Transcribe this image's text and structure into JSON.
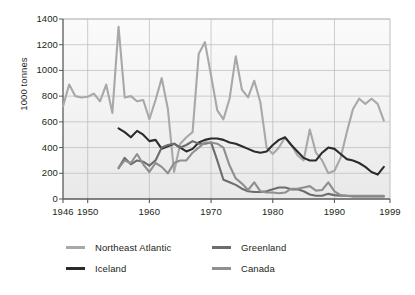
{
  "chart_data": {
    "type": "line",
    "title": "",
    "subtitle": "",
    "xlabel": "",
    "ylabel": "1000 tonnes",
    "xlim": [
      1946,
      1999
    ],
    "ylim": [
      0,
      1400
    ],
    "yticks": [
      0,
      200,
      400,
      600,
      800,
      1000,
      1200,
      1400
    ],
    "xticks": [
      1946,
      1950,
      1960,
      1970,
      1980,
      1990,
      1999
    ],
    "xtick_labels": [
      "1946",
      "1950",
      "1960",
      "1970",
      "1980",
      "1990",
      "1999"
    ],
    "ytick_labels": [
      "0",
      "200",
      "400",
      "600",
      "800",
      "1000",
      "1200",
      "1400"
    ],
    "grid": "horizontal-and-vertical",
    "legend_position": "bottom",
    "series": [
      {
        "name": "Northeast Atlantic",
        "color": "#a8a8a8",
        "x": [
          1946,
          1947,
          1948,
          1949,
          1950,
          1951,
          1952,
          1953,
          1954,
          1955,
          1956,
          1957,
          1958,
          1959,
          1960,
          1961,
          1962,
          1963,
          1964,
          1965,
          1966,
          1967,
          1968,
          1969,
          1970,
          1971,
          1972,
          1973,
          1974,
          1975,
          1976,
          1977,
          1978,
          1979,
          1980,
          1981,
          1982,
          1983,
          1984,
          1985,
          1986,
          1987,
          1988,
          1989,
          1990,
          1991,
          1992,
          1993,
          1994,
          1995,
          1996,
          1997,
          1998
        ],
        "values": [
          720,
          890,
          800,
          790,
          795,
          820,
          760,
          890,
          670,
          1340,
          790,
          800,
          760,
          770,
          620,
          770,
          940,
          700,
          210,
          430,
          480,
          520,
          1130,
          1220,
          960,
          690,
          620,
          780,
          1110,
          850,
          790,
          920,
          750,
          400,
          350,
          400,
          480,
          420,
          340,
          300,
          540,
          360,
          300,
          200,
          220,
          320,
          520,
          700,
          780,
          740,
          780,
          740,
          610
        ]
      },
      {
        "name": "Iceland",
        "color": "#2b2b2b",
        "x": [
          1955,
          1956,
          1957,
          1958,
          1959,
          1960,
          1961,
          1962,
          1963,
          1964,
          1965,
          1966,
          1967,
          1968,
          1969,
          1970,
          1971,
          1972,
          1973,
          1974,
          1975,
          1976,
          1977,
          1978,
          1979,
          1980,
          1981,
          1982,
          1983,
          1984,
          1985,
          1986,
          1987,
          1988,
          1989,
          1990,
          1991,
          1992,
          1993,
          1994,
          1995,
          1996,
          1997,
          1998
        ],
        "values": [
          550,
          520,
          480,
          530,
          500,
          450,
          460,
          390,
          410,
          430,
          400,
          370,
          390,
          440,
          460,
          470,
          470,
          460,
          440,
          430,
          410,
          390,
          370,
          360,
          370,
          420,
          460,
          480,
          420,
          370,
          320,
          300,
          300,
          360,
          400,
          390,
          350,
          310,
          300,
          280,
          250,
          210,
          190,
          250
        ]
      },
      {
        "name": "Greenland",
        "color": "#6d6d6d",
        "x": [
          1955,
          1956,
          1957,
          1958,
          1959,
          1960,
          1961,
          1962,
          1963,
          1964,
          1965,
          1966,
          1967,
          1968,
          1969,
          1970,
          1971,
          1972,
          1973,
          1974,
          1975,
          1976,
          1977,
          1978,
          1979,
          1980,
          1981,
          1982,
          1983,
          1984,
          1985,
          1986,
          1987,
          1988,
          1989,
          1990,
          1991,
          1992,
          1993,
          1994,
          1995,
          1996,
          1997,
          1998
        ],
        "values": [
          240,
          320,
          270,
          300,
          290,
          260,
          300,
          400,
          420,
          430,
          400,
          420,
          450,
          430,
          430,
          440,
          300,
          150,
          130,
          110,
          80,
          60,
          55,
          55,
          60,
          75,
          90,
          90,
          75,
          75,
          60,
          35,
          25,
          25,
          40,
          30,
          25,
          25,
          20,
          20,
          20,
          20,
          20,
          20
        ]
      },
      {
        "name": "Canada",
        "color": "#8f8f8f",
        "x": [
          1955,
          1956,
          1957,
          1958,
          1959,
          1960,
          1961,
          1962,
          1963,
          1964,
          1965,
          1966,
          1967,
          1968,
          1969,
          1970,
          1971,
          1972,
          1973,
          1974,
          1975,
          1976,
          1977,
          1978,
          1979,
          1980,
          1981,
          1982,
          1983,
          1984,
          1985,
          1986,
          1987,
          1988,
          1989,
          1990,
          1991,
          1992,
          1993,
          1994,
          1995,
          1996,
          1997,
          1998
        ],
        "values": [
          240,
          300,
          280,
          350,
          270,
          210,
          280,
          250,
          200,
          280,
          300,
          300,
          360,
          400,
          440,
          440,
          430,
          400,
          260,
          160,
          120,
          70,
          130,
          60,
          50,
          50,
          45,
          50,
          80,
          80,
          90,
          100,
          65,
          70,
          130,
          60,
          30,
          25,
          25,
          25,
          25,
          25,
          25,
          25
        ]
      }
    ]
  },
  "legend": {
    "items": [
      {
        "label": "Northeast Atlantic",
        "color": "#a8a8a8"
      },
      {
        "label": "Greenland",
        "color": "#6d6d6d"
      },
      {
        "label": "Iceland",
        "color": "#2b2b2b"
      },
      {
        "label": "Canada",
        "color": "#8f8f8f"
      }
    ]
  },
  "axes": {
    "y_title": "1000 tonnes"
  },
  "style": {
    "plot_bg_top": "#fbfbfb",
    "plot_bg_bottom": "#e9e9e9",
    "grid_color": "#b9b9b9",
    "axis_color": "#5a5a5a",
    "text_color": "#231f20"
  }
}
